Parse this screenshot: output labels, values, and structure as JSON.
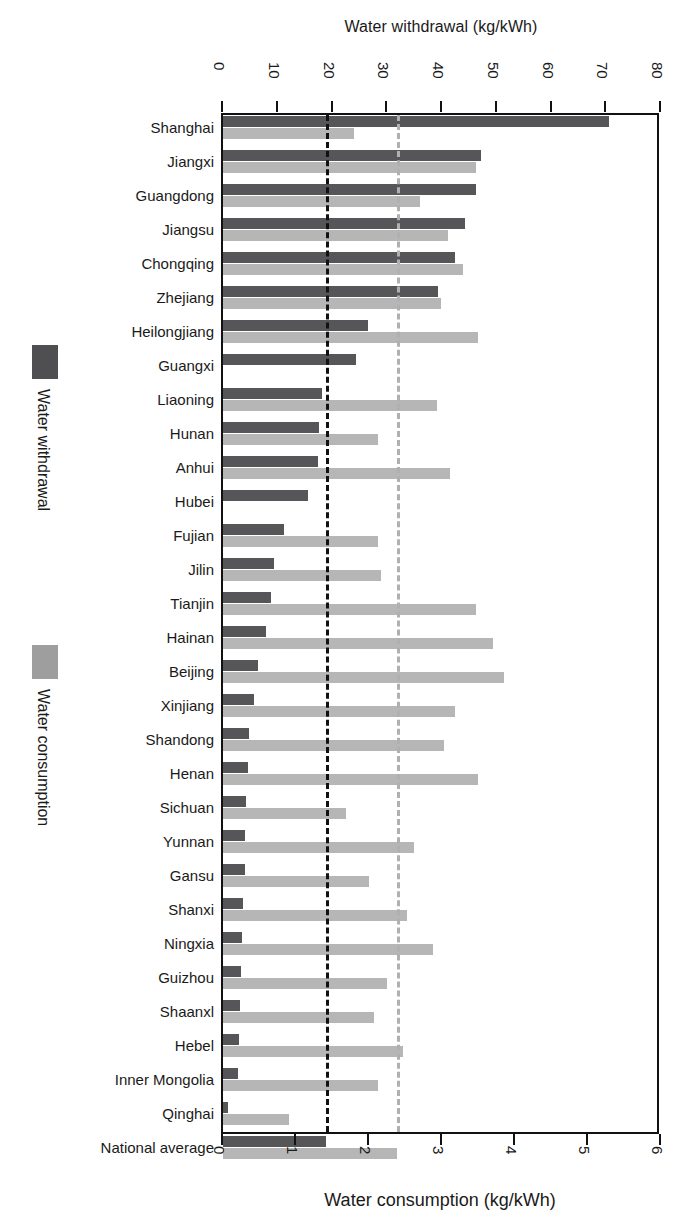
{
  "chart_data": {
    "type": "bar",
    "orientation": "horizontal",
    "title": "",
    "top_axis": {
      "label": "Water withdrawal (kg/kWh)",
      "ticks": [
        0,
        10,
        20,
        30,
        40,
        50,
        60,
        70,
        80
      ],
      "lim": [
        0,
        80
      ]
    },
    "bottom_axis": {
      "label": "Water consumption (kg/kWh)",
      "ticks": [
        0,
        1,
        2,
        3,
        4,
        5,
        6
      ],
      "lim": [
        0,
        6
      ]
    },
    "legend": {
      "position": "left-outside",
      "entries": [
        {
          "name": "Water withdrawal",
          "color": "#4f4f51"
        },
        {
          "name": "Water consumption",
          "color": "#9e9e9e"
        }
      ]
    },
    "reference_lines": [
      {
        "name": "national-average-withdrawal",
        "axis": "top",
        "value": 18.9,
        "style": "dashed",
        "color": "#111111"
      },
      {
        "name": "national-average-consumption",
        "axis": "bottom",
        "value": 2.38,
        "style": "dashed",
        "color": "#b0b0b0"
      }
    ],
    "grid": false,
    "categories": [
      "Shanghai",
      "Jiangxi",
      "Guangdong",
      "Jiangsu",
      "Chongqing",
      "Zhejiang",
      "Heilongjiang",
      "Guangxi",
      "Liaoning",
      "Hunan",
      "Anhui",
      "Hubei",
      "Fujian",
      "Jilin",
      "Tianjin",
      "Hainan",
      "Beijing",
      "Xinjiang",
      "Shandong",
      "Henan",
      "Sichuan",
      "Yunnan",
      "Gansu",
      "Shanxi",
      "Ningxia",
      "Guizhou",
      "Shaanxl",
      "Hebel",
      "Inner Mongolia",
      "Qinghai",
      "National average"
    ],
    "series": [
      {
        "name": "Water withdrawal",
        "axis": "top",
        "unit": "kg/kWh",
        "color": "#565658",
        "values": [
          70.5,
          47.2,
          46.3,
          44.2,
          42.3,
          39.2,
          26.4,
          24.3,
          18.1,
          17.6,
          17.4,
          15.6,
          11.2,
          9.3,
          8.8,
          7.9,
          6.4,
          5.6,
          4.8,
          4.5,
          4.2,
          4.1,
          4.0,
          3.7,
          3.4,
          3.2,
          3.1,
          2.9,
          2.8,
          0.9,
          18.9
        ]
      },
      {
        "name": "Water consumption",
        "axis": "bottom",
        "unit": "kg/kWh",
        "color": "#b6b6b6",
        "values": [
          1.79,
          3.46,
          2.7,
          3.08,
          3.29,
          2.99,
          3.49,
          0.0,
          2.93,
          2.13,
          3.11,
          0.0,
          2.12,
          2.16,
          3.47,
          3.7,
          3.85,
          3.18,
          3.03,
          3.49,
          1.68,
          2.62,
          2.0,
          2.52,
          2.88,
          2.24,
          2.07,
          2.46,
          2.12,
          0.9,
          2.38
        ]
      }
    ]
  }
}
